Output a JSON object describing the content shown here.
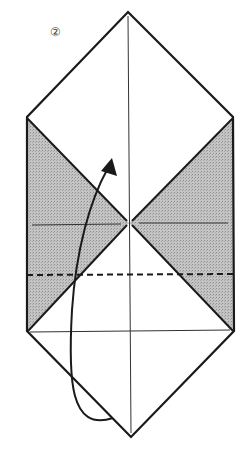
{
  "diagram": {
    "type": "origami-fold-step",
    "step_label": "②",
    "colors": {
      "line": "#1a1a1a",
      "shade": "#b8b8b8",
      "paper": "#ffffff"
    },
    "elements": {
      "outline": "hexagonal paper outline (diamond with squared sides)",
      "shaded_regions": [
        "left triangle flap",
        "right triangle flap"
      ],
      "center_crease": "vertical crease line",
      "horizontal_crease": "horizontal crease through center",
      "valley_fold_line": "dashed fold line",
      "arrow": "curved fold arrow from bottom point upward"
    }
  }
}
